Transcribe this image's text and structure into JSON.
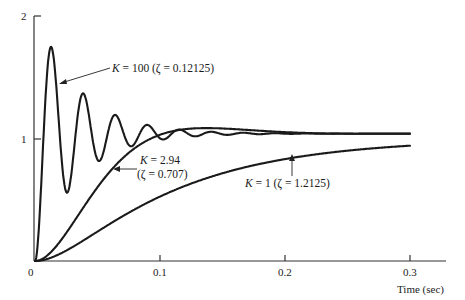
{
  "chart_data": {
    "type": "line",
    "title": "",
    "xlabel": "Time (sec)",
    "ylabel": "",
    "xlim": [
      0,
      0.33
    ],
    "ylim": [
      0,
      2
    ],
    "grid": false,
    "x_ticks": [
      {
        "value": 0,
        "label": "0"
      },
      {
        "value": 0.1,
        "label": "0.1"
      },
      {
        "value": 0.2,
        "label": "0.2"
      },
      {
        "value": 0.3,
        "label": "0.3"
      }
    ],
    "y_ticks": [
      {
        "value": 1,
        "label": "1"
      },
      {
        "value": 2,
        "label": "2"
      }
    ],
    "series": [
      {
        "name": "K = 100 (ζ = 0.12125)",
        "K": "100",
        "zeta": "0.12125",
        "model": {
          "zeta": 0.12125,
          "wn": 247,
          "final": 1.04
        },
        "key_points": [
          {
            "t": 0,
            "y": 0
          },
          {
            "t": 0.013,
            "y": 1.68
          },
          {
            "t": 0.03,
            "y": 0.56
          },
          {
            "t": 0.046,
            "y": 1.33
          },
          {
            "t": 0.062,
            "y": 0.84
          },
          {
            "t": 0.078,
            "y": 1.13
          },
          {
            "t": 0.3,
            "y": 1.04
          }
        ]
      },
      {
        "name": "K = 2.94 (ζ = 0.707)",
        "K": "2.94",
        "zeta": "0.707",
        "model": {
          "zeta": 0.707,
          "wn": 32.4,
          "final": 1.04
        },
        "key_points": [
          {
            "t": 0,
            "y": 0
          },
          {
            "t": 0.062,
            "y": 0.75
          },
          {
            "t": 0.1,
            "y": 1.03
          },
          {
            "t": 0.137,
            "y": 1.08
          },
          {
            "t": 0.2,
            "y": 1.05
          },
          {
            "t": 0.3,
            "y": 1.04
          }
        ]
      },
      {
        "name": "K = 1 (ζ = 1.2125)",
        "K": "1",
        "zeta": "1.2125",
        "model": {
          "zeta": 1.2125,
          "wn": 20,
          "final": 1.0
        },
        "key_points": [
          {
            "t": 0,
            "y": 0
          },
          {
            "t": 0.1,
            "y": 0.47
          },
          {
            "t": 0.2,
            "y": 0.82
          },
          {
            "t": 0.3,
            "y": 0.97
          }
        ]
      }
    ],
    "annotations": [
      {
        "text_k": "K",
        "text_rest": " = 100 (ζ = 0.12125)",
        "series": 0
      },
      {
        "text_k": "K",
        "text_rest": " = 2.94",
        "line2": "(ζ = 0.707)",
        "series": 1
      },
      {
        "text_k": "K",
        "text_rest": " = 1 (ζ = 1.2125)",
        "series": 2
      }
    ]
  }
}
